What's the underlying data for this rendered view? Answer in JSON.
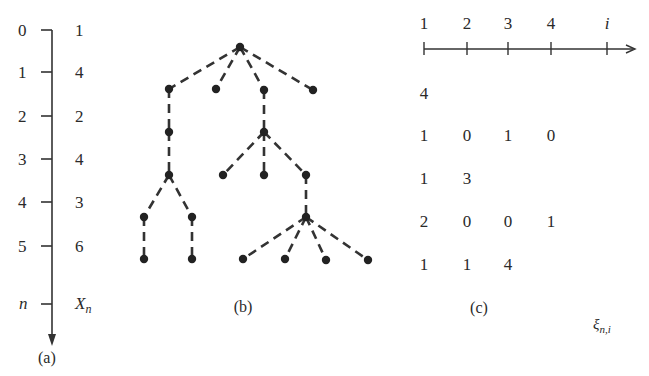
{
  "panel_a": {
    "caption": "(a)",
    "axis_label_n": "n",
    "axis_label_x": "X",
    "axis_label_x_sub": "n",
    "rows": [
      {
        "n": "0",
        "x": "1"
      },
      {
        "n": "1",
        "x": "4"
      },
      {
        "n": "2",
        "x": "2"
      },
      {
        "n": "3",
        "x": "4"
      },
      {
        "n": "4",
        "x": "3"
      },
      {
        "n": "5",
        "x": "6"
      }
    ]
  },
  "panel_b": {
    "caption": "(b)",
    "tree": {
      "description": "Branching process family tree with dashed edges",
      "generations": [
        1,
        4,
        2,
        4,
        3,
        6
      ]
    }
  },
  "panel_c": {
    "caption": "(c)",
    "axis_ticks": [
      "1",
      "2",
      "3",
      "4",
      "i"
    ],
    "label_xi": "ξ",
    "label_xi_sub": "n,i",
    "rows": [
      [
        "4"
      ],
      [
        "1",
        "0",
        "1",
        "0"
      ],
      [
        "1",
        "3"
      ],
      [
        "2",
        "0",
        "0",
        "1"
      ],
      [
        "1",
        "1",
        "4"
      ]
    ]
  }
}
